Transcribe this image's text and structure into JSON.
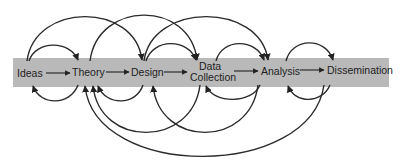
{
  "diagram": {
    "type": "research-process-flow",
    "colors": {
      "band": "#b9b9b9",
      "line": "#2a2a2a",
      "text": "#222222",
      "background": "#ffffff"
    },
    "band": {
      "x": 13,
      "y": 58,
      "width": 376,
      "height": 29
    },
    "nodes": [
      {
        "id": "ideas",
        "label": "Ideas",
        "x": 17,
        "y": 77
      },
      {
        "id": "theory",
        "label": "Theory",
        "x": 72,
        "y": 77
      },
      {
        "id": "design",
        "label": "Design",
        "x": 131,
        "y": 77
      },
      {
        "id": "data_collection",
        "label_line1": "Data",
        "label_line2": "Collection",
        "x": 191,
        "y": 70
      },
      {
        "id": "analysis",
        "label": "Analysis",
        "x": 260,
        "y": 77
      },
      {
        "id": "dissemination",
        "label": "Dissemination",
        "x": 327,
        "y": 76
      }
    ],
    "flow_arrows": [
      {
        "from": "ideas",
        "to": "theory"
      },
      {
        "from": "theory",
        "to": "design"
      },
      {
        "from": "design",
        "to": "data_collection"
      },
      {
        "from": "data_collection",
        "to": "analysis"
      },
      {
        "from": "analysis",
        "to": "dissemination"
      }
    ],
    "feedforward_arcs": [
      {
        "from": "ideas",
        "to": "theory"
      },
      {
        "from": "ideas",
        "to": "design"
      },
      {
        "from": "theory",
        "to": "data_collection"
      },
      {
        "from": "design",
        "to": "data_collection"
      },
      {
        "from": "design",
        "to": "analysis"
      },
      {
        "from": "data_collection",
        "to": "analysis"
      },
      {
        "from": "analysis",
        "to": "dissemination"
      }
    ],
    "feedback_arcs": [
      {
        "from": "theory",
        "to": "ideas"
      },
      {
        "from": "design",
        "to": "theory"
      },
      {
        "from": "data_collection",
        "to": "theory"
      },
      {
        "from": "analysis",
        "to": "design"
      },
      {
        "from": "dissemination",
        "to": "theory"
      },
      {
        "from": "analysis",
        "to": "data_collection"
      },
      {
        "from": "dissemination",
        "to": "analysis"
      }
    ]
  }
}
